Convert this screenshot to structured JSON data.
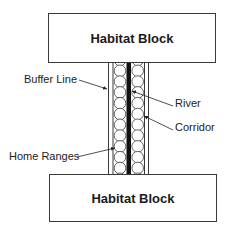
{
  "diagram": {
    "title": "",
    "blocks": {
      "top": {
        "label": "Habitat Block"
      },
      "bottom": {
        "label": "Habitat Block"
      }
    },
    "labels": {
      "buffer_line": "Buffer Line",
      "river": "River",
      "corridor": "Corridor",
      "home_ranges": "Home Ranges"
    },
    "corridor": {
      "home_range_columns": 2,
      "home_ranges_per_column": 11,
      "river_color": "#111111",
      "line_color": "#3a3a3a"
    }
  }
}
